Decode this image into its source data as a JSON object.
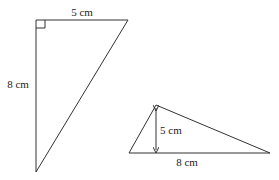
{
  "triangle_right": {
    "top_label": "5 cm",
    "side_label": "8 cm",
    "right_angle": true
  },
  "triangle_obtuse": {
    "height_label": "5 cm",
    "base_label": "8 cm"
  }
}
